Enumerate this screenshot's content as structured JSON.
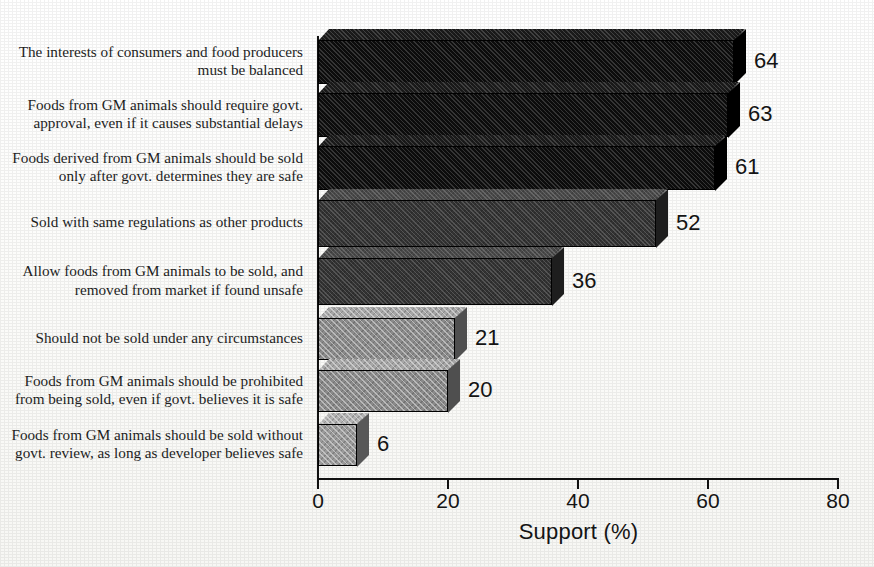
{
  "chart_data": {
    "type": "bar",
    "orientation": "horizontal",
    "title": "",
    "xlabel": "Support (%)",
    "ylabel": "",
    "xlim": [
      0,
      80
    ],
    "xticks": [
      0,
      20,
      40,
      60,
      80
    ],
    "xtick_labels": [
      "0",
      "20",
      "40",
      "60",
      "80"
    ],
    "grid": false,
    "legend": null,
    "categories": [
      "The interests of consumers and food producers must be balanced",
      "Foods from GM animals should require govt. approval, even if it causes substantial delays",
      "Foods derived from GM animals should be sold only after govt. determines they are safe",
      "Sold with same regulations as other products",
      "Allow foods from GM animals to be sold, and removed from market if found unsafe",
      "Should not be sold under any circumstances",
      "Foods from GM animals should be prohibited from being sold, even if govt. believes it is safe",
      "Foods from GM animals should be sold without govt. review, as long as developer believes safe"
    ],
    "values": [
      64,
      63,
      61,
      52,
      36,
      21,
      20,
      6
    ],
    "value_labels": [
      "64",
      "63",
      "61",
      "52",
      "36",
      "21",
      "20",
      "6"
    ],
    "bar_fill_colors": [
      "#0d0d0d",
      "#0d0d0d",
      "#0d0d0d",
      "#333333",
      "#333333",
      "#8a8a8a",
      "#8a8a8a",
      "#9a9a9a"
    ],
    "bar_top_colors": [
      "#1c1c1c",
      "#1c1c1c",
      "#1c1c1c",
      "#4a4a4a",
      "#4a4a4a",
      "#a6a6a6",
      "#a6a6a6",
      "#b2b2b2"
    ],
    "bar_side_colors": [
      "#000000",
      "#000000",
      "#000000",
      "#1e1e1e",
      "#1e1e1e",
      "#4f4f4f",
      "#4f4f4f",
      "#585858"
    ]
  },
  "rows": [
    {
      "label_line1": "The interests of consumers and food producers",
      "label_line2": "must be balanced",
      "value": "64"
    },
    {
      "label_line1": "Foods from GM animals should require govt.",
      "label_line2": "approval, even if it causes substantial delays",
      "value": "63"
    },
    {
      "label_line1": "Foods derived from GM animals should be sold",
      "label_line2": "only after govt. determines they are safe",
      "value": "61"
    },
    {
      "label_line1": "Sold with same regulations as other products",
      "label_line2": "",
      "value": "52"
    },
    {
      "label_line1": "Allow foods from GM animals to be sold, and",
      "label_line2": "removed from market if found unsafe",
      "value": "36"
    },
    {
      "label_line1": "Should not be sold under any circumstances",
      "label_line2": "",
      "value": "21"
    },
    {
      "label_line1": "Foods from GM animals should be prohibited",
      "label_line2": "from being sold, even if govt. believes it is safe",
      "value": "20"
    },
    {
      "label_line1": "Foods from GM animals should be sold without",
      "label_line2": "govt. review, as long as developer believes safe",
      "value": "6"
    }
  ],
  "axis": {
    "title": "Support (%)",
    "ticks": [
      "0",
      "20",
      "40",
      "60",
      "80"
    ]
  }
}
